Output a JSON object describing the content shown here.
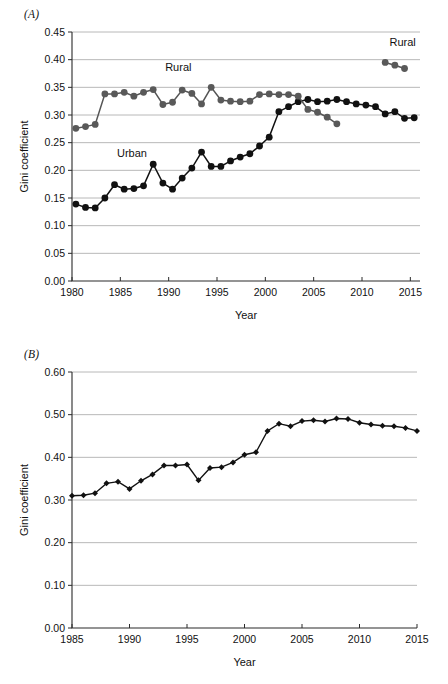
{
  "figure": {
    "panels": [
      {
        "id": "A",
        "label": "(A)",
        "xlabel": "Year",
        "ylabel": "Gini coefficient"
      },
      {
        "id": "B",
        "label": "(B)",
        "xlabel": "Year",
        "ylabel": "Gini coefficient"
      }
    ]
  },
  "chart_data": [
    {
      "type": "line",
      "panel": "A",
      "title": "",
      "xlabel": "Year",
      "ylabel": "Gini coefficient",
      "xlim": [
        1980,
        2016
      ],
      "ylim": [
        0.0,
        0.45
      ],
      "xticks": [
        1980,
        1985,
        1990,
        1995,
        2000,
        2005,
        2010,
        2015
      ],
      "xticklabels": [
        "1980",
        "1985",
        "1990",
        "1995",
        "2000",
        "2005",
        "2010",
        "2015"
      ],
      "yticks": [
        0.0,
        0.05,
        0.1,
        0.15,
        0.2,
        0.25,
        0.3,
        0.35,
        0.4,
        0.45
      ],
      "yticklabels": [
        "0.00",
        "0.05",
        "0.10",
        "0.15",
        "0.20",
        "0.25",
        "0.30",
        "0.35",
        "0.40",
        "0.45"
      ],
      "grid": "horizontal",
      "legend": "inline-annotation",
      "annotations": [
        {
          "text": "Rural",
          "x": 1991.0,
          "y": 0.379
        },
        {
          "text": "Urban",
          "x": 1986.2,
          "y": 0.224
        },
        {
          "text": "Rural",
          "x": 2014.2,
          "y": 0.424
        }
      ],
      "series": [
        {
          "name": "Urban",
          "color": "#111111",
          "marker": "circle",
          "x": [
            1980.4,
            1981.4,
            1982.4,
            1983.4,
            1984.4,
            1985.4,
            1986.4,
            1987.4,
            1988.4,
            1989.4,
            1990.4,
            1991.4,
            1992.4,
            1993.4,
            1994.4,
            1995.4,
            1996.4,
            1997.4,
            1998.4,
            1999.4,
            2000.4,
            2001.4,
            2002.4,
            2003.4,
            2004.4,
            2005.4,
            2006.4,
            2007.4,
            2008.4,
            2009.4,
            2010.4,
            2011.4,
            2012.4,
            2013.4,
            2014.4,
            2015.4
          ],
          "y": [
            0.139,
            0.133,
            0.132,
            0.15,
            0.174,
            0.166,
            0.167,
            0.172,
            0.211,
            0.177,
            0.166,
            0.186,
            0.204,
            0.233,
            0.207,
            0.207,
            0.217,
            0.224,
            0.23,
            0.244,
            0.26,
            0.306,
            0.315,
            0.324,
            0.328,
            0.324,
            0.325,
            0.328,
            0.324,
            0.32,
            0.318,
            0.315,
            0.302,
            0.306,
            0.294,
            0.295
          ]
        },
        {
          "name": "Rural",
          "color": "#595959",
          "marker": "circle",
          "x": [
            1980.4,
            1981.4,
            1982.4,
            1983.4,
            1984.4,
            1985.4,
            1986.4,
            1987.4,
            1988.4,
            1989.4,
            1990.4,
            1991.4,
            1992.4,
            1993.4,
            1994.4,
            1995.4,
            1996.4,
            1997.4,
            1998.4,
            1999.4,
            2000.4,
            2001.4,
            2002.4,
            2003.4,
            2004.4,
            2005.4,
            2006.4,
            2007.4
          ],
          "y": [
            0.276,
            0.279,
            0.283,
            0.338,
            0.338,
            0.341,
            0.334,
            0.341,
            0.346,
            0.319,
            0.323,
            0.345,
            0.339,
            0.32,
            0.35,
            0.327,
            0.325,
            0.324,
            0.325,
            0.337,
            0.338,
            0.337,
            0.337,
            0.334,
            0.31,
            0.305,
            0.296,
            0.284
          ]
        },
        {
          "name": "Rural (later)",
          "color": "#595959",
          "marker": "circle",
          "x": [
            2012.4,
            2013.4,
            2014.4
          ],
          "y": [
            0.395,
            0.39,
            0.384
          ]
        }
      ]
    },
    {
      "type": "line",
      "panel": "B",
      "title": "",
      "xlabel": "Year",
      "ylabel": "Gini coefficient",
      "xlim": [
        1985,
        2015
      ],
      "ylim": [
        0.0,
        0.6
      ],
      "xticks": [
        1985,
        1990,
        1995,
        2000,
        2005,
        2010,
        2015
      ],
      "xticklabels": [
        "1985",
        "1990",
        "1995",
        "2000",
        "2005",
        "2010",
        "2015"
      ],
      "yticks": [
        0.0,
        0.1,
        0.2,
        0.3,
        0.4,
        0.5,
        0.6
      ],
      "yticklabels": [
        "0.00",
        "0.10",
        "0.20",
        "0.30",
        "0.40",
        "0.50",
        "0.60"
      ],
      "grid": "horizontal",
      "legend": "none",
      "annotations": [],
      "series": [
        {
          "name": "National",
          "color": "#111111",
          "marker": "diamond",
          "x": [
            1985,
            1986,
            1987,
            1988,
            1989,
            1990,
            1991,
            1992,
            1993,
            1994,
            1995,
            1996,
            1997,
            1998,
            1999,
            2000,
            2001,
            2002,
            2003,
            2004,
            2005,
            2006,
            2007,
            2008,
            2009,
            2010,
            2011,
            2012,
            2013,
            2014,
            2015
          ],
          "y": [
            0.31,
            0.311,
            0.316,
            0.339,
            0.343,
            0.326,
            0.345,
            0.36,
            0.381,
            0.381,
            0.383,
            0.346,
            0.375,
            0.377,
            0.388,
            0.406,
            0.412,
            0.462,
            0.479,
            0.473,
            0.485,
            0.487,
            0.484,
            0.491,
            0.49,
            0.481,
            0.477,
            0.474,
            0.473,
            0.469,
            0.462
          ]
        }
      ]
    }
  ]
}
